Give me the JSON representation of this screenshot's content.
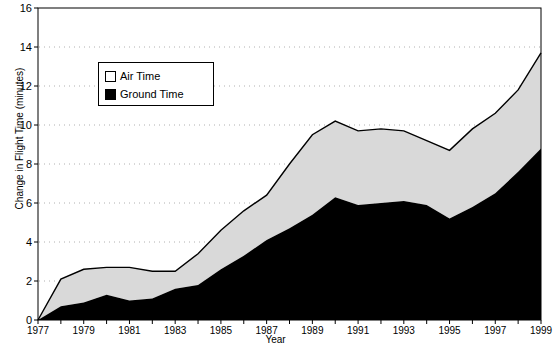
{
  "chart_data": {
    "type": "area",
    "stacked": true,
    "title": "",
    "xlabel": "Year",
    "ylabel": "Change in Flight Time (minutes)",
    "xlim": [
      1977,
      1999
    ],
    "ylim": [
      0,
      16
    ],
    "ytick_values": [
      0,
      2,
      4,
      6,
      8,
      10,
      12,
      14,
      16
    ],
    "xtick_values": [
      1977,
      1979,
      1981,
      1983,
      1985,
      1987,
      1989,
      1991,
      1993,
      1995,
      1997,
      1999
    ],
    "grid": "horizontal-dotted",
    "legend_position": "upper-left-inside",
    "x": [
      1977,
      1978,
      1979,
      1980,
      1981,
      1982,
      1983,
      1984,
      1985,
      1986,
      1987,
      1988,
      1989,
      1990,
      1991,
      1992,
      1993,
      1994,
      1995,
      1996,
      1997,
      1998,
      1999
    ],
    "series": [
      {
        "name": "Ground Time",
        "color": "#000000",
        "values": [
          0.0,
          0.7,
          0.9,
          1.3,
          1.0,
          1.1,
          1.6,
          1.8,
          2.6,
          3.3,
          4.1,
          4.7,
          5.4,
          6.3,
          5.9,
          6.0,
          6.1,
          5.9,
          5.2,
          5.8,
          6.5,
          7.6,
          8.8
        ]
      },
      {
        "name": "Air Time",
        "color": "#d9d9d9",
        "values": [
          0.0,
          1.4,
          1.7,
          1.4,
          1.7,
          1.4,
          0.9,
          1.6,
          2.0,
          2.3,
          2.3,
          3.3,
          4.1,
          3.9,
          3.8,
          3.8,
          3.6,
          3.3,
          3.5,
          4.0,
          4.1,
          4.2,
          4.9
        ]
      }
    ],
    "totals": [
      0.0,
      2.1,
      2.6,
      2.7,
      2.7,
      2.5,
      2.5,
      3.4,
      4.6,
      5.6,
      6.4,
      8.0,
      9.5,
      10.2,
      9.7,
      9.8,
      9.7,
      9.2,
      8.7,
      9.8,
      10.6,
      11.8,
      13.7
    ]
  },
  "legend": {
    "items": [
      {
        "label": "Air Time",
        "swatch": "white-square"
      },
      {
        "label": "Ground Time",
        "swatch": "black-square"
      }
    ]
  },
  "axes": {
    "ylabel": "Change in Flight Time (minutes)",
    "xlabel": "Year",
    "yticks": [
      "0",
      "2",
      "4",
      "6",
      "8",
      "10",
      "12",
      "14",
      "16"
    ],
    "xticks": [
      "1977",
      "1979",
      "1981",
      "1983",
      "1985",
      "1987",
      "1989",
      "1991",
      "1993",
      "1995",
      "1997",
      "1999"
    ]
  },
  "colors": {
    "air_fill": "#d9d9d9",
    "ground_fill": "#000000",
    "line": "#000000",
    "grid": "#b0b0b0",
    "axis": "#000000",
    "background": "#ffffff"
  }
}
